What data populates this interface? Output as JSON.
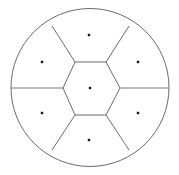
{
  "figure": {
    "type": "geometric-diagram",
    "background_color": "#ffffff",
    "width": 179,
    "height": 175
  },
  "chart_data": {
    "type": "scatter",
    "subtitle": "Seven-cell hexagonal packing inscribed in a circle",
    "xlabel": "",
    "ylabel": "",
    "xlim": [
      11,
      169
    ],
    "ylim": [
      8,
      167
    ],
    "grid": false,
    "legend": null,
    "annotations": [],
    "series": [
      {
        "name": "seed-points",
        "marker": "square-dot",
        "color": "#1a1a1a",
        "points": [
          {
            "id": "center",
            "x": 90,
            "y": 88,
            "label": ""
          },
          {
            "id": "north",
            "x": 89,
            "y": 35,
            "label": ""
          },
          {
            "id": "northwest",
            "x": 42,
            "y": 62,
            "label": ""
          },
          {
            "id": "northeast",
            "x": 138,
            "y": 62,
            "label": ""
          },
          {
            "id": "southwest",
            "x": 42,
            "y": 113,
            "label": ""
          },
          {
            "id": "southeast",
            "x": 138,
            "y": 113,
            "label": ""
          },
          {
            "id": "south",
            "x": 89,
            "y": 140,
            "label": ""
          }
        ]
      }
    ]
  },
  "geometry": {
    "circle": {
      "name": "outer-boundary",
      "cx": 90,
      "cy": 87.5,
      "r": 79,
      "stroke": "#5a5a5a",
      "stroke_width": 0.9,
      "fill": "#ffffff"
    },
    "hexagon": {
      "name": "central-cell",
      "stroke": "#6b6b6b",
      "stroke_width": 1.0,
      "fill": "#ffffff",
      "vertices": [
        {
          "x": 75,
          "y": 62
        },
        {
          "x": 106,
          "y": 62
        },
        {
          "x": 120,
          "y": 88
        },
        {
          "x": 106,
          "y": 115
        },
        {
          "x": 75,
          "y": 115
        },
        {
          "x": 63,
          "y": 88
        }
      ]
    },
    "spokes": [
      {
        "name": "spoke-upper-left",
        "from": {
          "x": 75,
          "y": 62
        },
        "to": {
          "x": 52,
          "y": 26
        },
        "stroke": "#6b6b6b",
        "stroke_width": 1.0
      },
      {
        "name": "spoke-upper-right",
        "from": {
          "x": 106,
          "y": 62
        },
        "to": {
          "x": 129,
          "y": 26
        },
        "stroke": "#6b6b6b",
        "stroke_width": 1.0
      },
      {
        "name": "spoke-right",
        "from": {
          "x": 120,
          "y": 88
        },
        "to": {
          "x": 169,
          "y": 88
        },
        "stroke": "#7a7a7a",
        "stroke_width": 1.0
      },
      {
        "name": "spoke-lower-right",
        "from": {
          "x": 106,
          "y": 115
        },
        "to": {
          "x": 129,
          "y": 150
        },
        "stroke": "#6b6b6b",
        "stroke_width": 1.0
      },
      {
        "name": "spoke-lower-left",
        "from": {
          "x": 75,
          "y": 115
        },
        "to": {
          "x": 52,
          "y": 150
        },
        "stroke": "#6b6b6b",
        "stroke_width": 1.0
      },
      {
        "name": "spoke-left",
        "from": {
          "x": 63,
          "y": 88
        },
        "to": {
          "x": 11,
          "y": 88
        },
        "stroke": "#7a7a7a",
        "stroke_width": 1.0
      }
    ],
    "seed_marker": {
      "name": "seed-dot",
      "size": 2.4,
      "color": "#151515",
      "shape": "square"
    }
  },
  "cells": [
    {
      "id": "center",
      "name": "cell-center",
      "sides": 6
    },
    {
      "id": "north",
      "name": "cell-north",
      "sides": 4
    },
    {
      "id": "northwest",
      "name": "cell-northwest",
      "sides": 4
    },
    {
      "id": "northeast",
      "name": "cell-northeast",
      "sides": 4
    },
    {
      "id": "southwest",
      "name": "cell-southwest",
      "sides": 4
    },
    {
      "id": "southeast",
      "name": "cell-southeast",
      "sides": 4
    },
    {
      "id": "south",
      "name": "cell-south",
      "sides": 4
    }
  ]
}
